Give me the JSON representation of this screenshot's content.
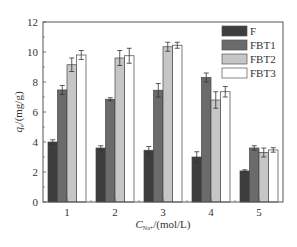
{
  "chart_data": {
    "type": "bar",
    "title": "",
    "xlabel": "C_Na+/(mol/L)",
    "xlabel_parts": {
      "symbol": "C",
      "subscript": "Na+",
      "unit": "/(mol/L)"
    },
    "ylabel": "q_e/(mg/g)",
    "ylabel_parts": {
      "symbol": "q",
      "subscript": "e",
      "unit": "/(mg/g)"
    },
    "categories": [
      "1",
      "2",
      "3",
      "4",
      "5"
    ],
    "ylim": [
      0,
      12
    ],
    "yticks": [
      0,
      2,
      4,
      6,
      8,
      10,
      12
    ],
    "grid": false,
    "legend_position": "upper right",
    "series": [
      {
        "name": "F",
        "color": "#3d3d3d",
        "values": [
          4.0,
          3.6,
          3.45,
          3.0,
          2.07
        ],
        "errors": [
          0.15,
          0.15,
          0.25,
          0.35,
          0.08
        ]
      },
      {
        "name": "FBT1",
        "color": "#6b6b6b",
        "values": [
          7.47,
          6.85,
          7.45,
          8.3,
          3.6
        ],
        "errors": [
          0.3,
          0.1,
          0.45,
          0.3,
          0.15
        ]
      },
      {
        "name": "FBT2",
        "color": "#c6c6c6",
        "values": [
          9.15,
          9.6,
          10.35,
          6.8,
          3.3
        ],
        "errors": [
          0.45,
          0.5,
          0.3,
          0.55,
          0.3
        ]
      },
      {
        "name": "FBT3",
        "color": "#ffffff",
        "values": [
          9.8,
          9.75,
          10.45,
          7.35,
          3.47
        ],
        "errors": [
          0.3,
          0.5,
          0.2,
          0.35,
          0.15
        ]
      }
    ]
  }
}
